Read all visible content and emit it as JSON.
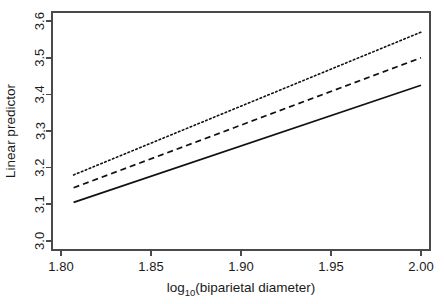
{
  "chart_data": {
    "type": "line",
    "title": "",
    "subtitle": "",
    "xlabel": "log10(biparietal diameter)",
    "xlabel_base": "log",
    "xlabel_sub": "10",
    "xlabel_rest": "(biparietal diameter)",
    "ylabel": "Linear predictor",
    "xlim": [
      1.795,
      2.005
    ],
    "ylim": [
      2.975,
      3.625
    ],
    "xticks": [
      1.8,
      1.85,
      1.9,
      1.95,
      2.0
    ],
    "xticklabels": [
      "1.80",
      "1.85",
      "1.90",
      "1.95",
      "2.00"
    ],
    "yticks": [
      3.0,
      3.1,
      3.2,
      3.3,
      3.4,
      3.5,
      3.6
    ],
    "yticklabels": [
      "3.0",
      "3.1",
      "3.2",
      "3.3",
      "3.4",
      "3.5",
      "3.6"
    ],
    "grid": false,
    "legend": null,
    "legend_position": "none",
    "box": true,
    "series": [
      {
        "name": "upper",
        "style": "dotted",
        "color": "#111111",
        "x": [
          1.807,
          2.0
        ],
        "values": [
          3.18,
          3.57
        ]
      },
      {
        "name": "middle",
        "style": "dashed",
        "color": "#111111",
        "x": [
          1.807,
          2.0
        ],
        "values": [
          3.145,
          3.5
        ]
      },
      {
        "name": "lower",
        "style": "solid",
        "color": "#111111",
        "x": [
          1.807,
          2.0
        ],
        "values": [
          3.105,
          3.425
        ]
      }
    ]
  },
  "plot_geometry": {
    "left": 52,
    "right": 430,
    "top": 12,
    "bottom": 250
  }
}
